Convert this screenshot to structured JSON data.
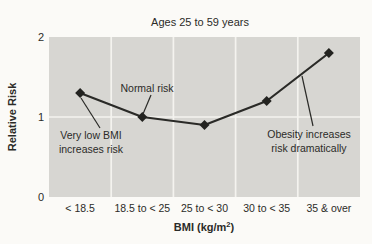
{
  "chart_data": {
    "type": "line",
    "title": "Ages 25 to 59 years",
    "categories": [
      "< 18.5",
      "18.5 to < 25",
      "25 to < 30",
      "30 to < 35",
      "35 & over"
    ],
    "series": [
      {
        "name": "Relative Risk",
        "values": [
          1.3,
          1.0,
          0.9,
          1.2,
          1.8
        ]
      }
    ],
    "xlabel": {
      "prefix": "BMI (kg/m",
      "sup": "2",
      "suffix": ")"
    },
    "ylabel": "Relative Risk",
    "ylim": [
      0,
      2
    ],
    "yticks": [
      0,
      1,
      2
    ],
    "grid": true,
    "legend": "none",
    "marker": "diamond",
    "colors": {
      "plot_bg": "#d7d6d2",
      "grid": "#f4f3ef",
      "line": "#2a2a27",
      "marker": "#232320",
      "text": "#2b2b28",
      "page_bg": "#fbfaf7"
    },
    "annotations": [
      {
        "name": "very-low-bmi-note",
        "lines": [
          "Very low BMI",
          "increases risk"
        ],
        "label_x": 91,
        "label_y": 139,
        "leader": [
          81,
          98,
          100,
          128
        ]
      },
      {
        "name": "normal-risk-note",
        "lines": [
          "Normal risk"
        ],
        "label_x": 147,
        "label_y": 92,
        "leader": [
          151,
          95,
          143,
          114
        ]
      },
      {
        "name": "obesity-note",
        "lines": [
          "Obesity increases",
          "risk dramatically"
        ],
        "label_x": 309,
        "label_y": 138,
        "leader": [
          302,
          76,
          313,
          126
        ]
      }
    ]
  }
}
